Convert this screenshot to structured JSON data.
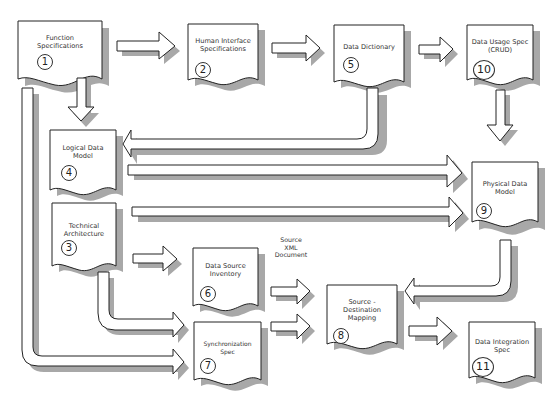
{
  "diagram": {
    "documents": [
      {
        "id": 1,
        "lines": [
          "Function",
          "Specifications"
        ]
      },
      {
        "id": 2,
        "lines": [
          "Human Interface",
          "Specifications"
        ]
      },
      {
        "id": 3,
        "lines": [
          "Technical",
          "Architecture"
        ]
      },
      {
        "id": 4,
        "lines": [
          "Logical Data",
          "Model"
        ]
      },
      {
        "id": 5,
        "lines": [
          "Data  Dictionary"
        ]
      },
      {
        "id": 6,
        "lines": [
          "Data Source",
          "Inventory"
        ]
      },
      {
        "id": 7,
        "lines": [
          "Synchronization",
          "Spec"
        ]
      },
      {
        "id": 8,
        "lines": [
          "Source -",
          "Destination",
          "Mapping"
        ]
      },
      {
        "id": 9,
        "lines": [
          "Physical Data",
          "Model"
        ]
      },
      {
        "id": 10,
        "lines": [
          "Data Usage Spec",
          "(CRUD)"
        ]
      },
      {
        "id": 11,
        "lines": [
          "Data Integration",
          "Spec"
        ]
      }
    ],
    "numbers": {
      "d1": "1",
      "d2": "2",
      "d3": "3",
      "d4": "4",
      "d5": "5",
      "d6": "6",
      "d7": "7",
      "d8": "8",
      "d9": "9",
      "d10": "10",
      "d11": "11"
    },
    "annotation": {
      "lines": [
        "Source",
        "XML",
        "Document"
      ]
    },
    "flows": [
      {
        "from": 1,
        "to": 2
      },
      {
        "from": 2,
        "to": 5
      },
      {
        "from": 5,
        "to": 10
      },
      {
        "from": 1,
        "to": 4
      },
      {
        "from": 5,
        "to": 4
      },
      {
        "from": 10,
        "to": 9
      },
      {
        "from": 4,
        "to": 9
      },
      {
        "from": 3,
        "to": 9
      },
      {
        "from": 3,
        "to": 6
      },
      {
        "from": 3,
        "to": 7
      },
      {
        "from": 1,
        "to": 7
      },
      {
        "from": 6,
        "to": 8
      },
      {
        "from": 7,
        "to": 8
      },
      {
        "from": 9,
        "to": 8
      },
      {
        "from": 8,
        "to": 11
      }
    ],
    "colors": {
      "shadow": "#a8a8a8",
      "outline": "#222222",
      "fill": "#ffffff"
    }
  }
}
